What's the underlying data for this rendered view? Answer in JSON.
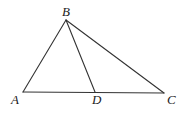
{
  "diagram": {
    "type": "geometry-triangle",
    "points": {
      "A": {
        "label": "A",
        "x": 23,
        "y": 92
      },
      "B": {
        "label": "B",
        "x": 66,
        "y": 20
      },
      "C": {
        "label": "C",
        "x": 164,
        "y": 93
      },
      "D": {
        "label": "D",
        "x": 95,
        "y": 92
      }
    },
    "segments": [
      {
        "from": "A",
        "to": "B"
      },
      {
        "from": "B",
        "to": "C"
      },
      {
        "from": "A",
        "to": "C"
      },
      {
        "from": "B",
        "to": "D"
      }
    ],
    "colors": {
      "stroke": "#333333",
      "label": "#222222",
      "background": "#ffffff"
    }
  }
}
